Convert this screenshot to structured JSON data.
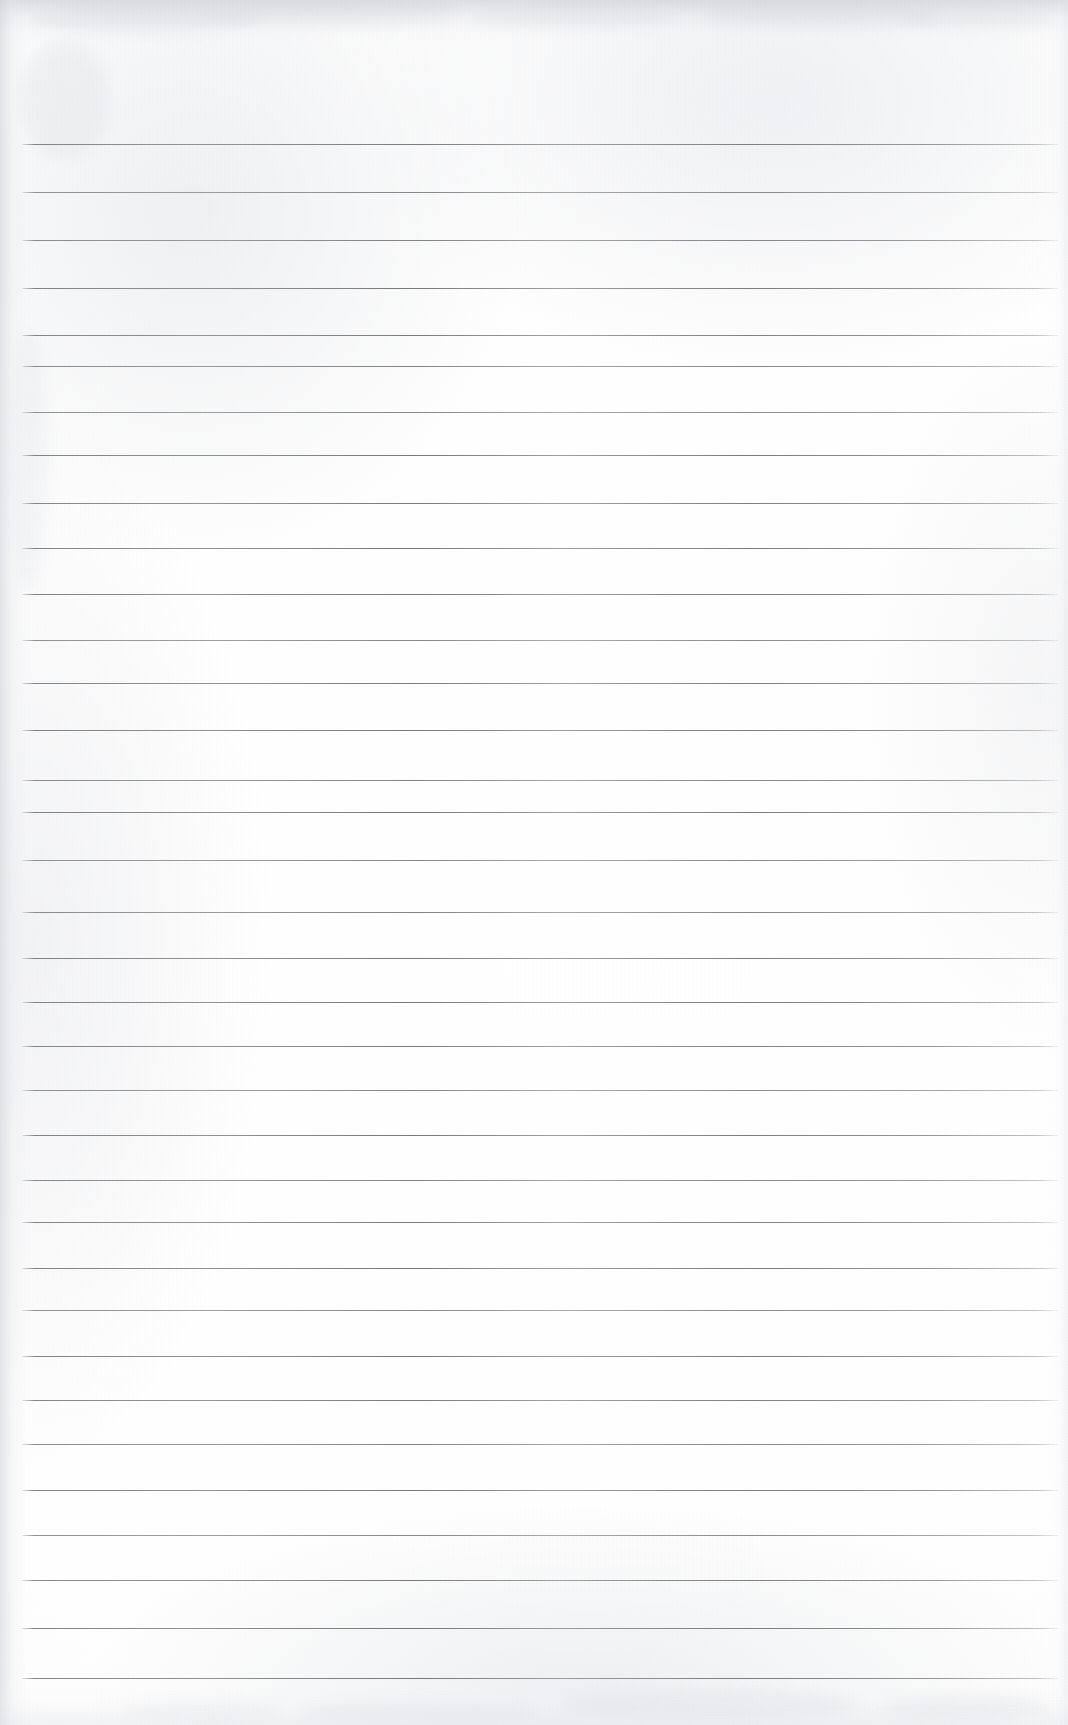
{
  "document": {
    "type": "scanned-blank-ruled-paper",
    "title": "Blank Ruled Notebook Page",
    "has_text_content": false,
    "visible_text": "",
    "page_width_px": 1068,
    "page_height_px": 1725
  },
  "paper": {
    "background_color": "#ffffff",
    "tone_color": "#fbfbfc",
    "edge_shadow_color": "#c4c7cd",
    "smudge_color": "#d8dbe0"
  },
  "ruling": {
    "line_color": "#767981",
    "line_thickness_px": 1,
    "line_count": 33,
    "left_x_px": 22,
    "right_x_px": 1058,
    "first_line_y_px": 144,
    "spacing_px": 47.9,
    "lines_y_px": [
      144,
      192,
      240,
      288,
      335,
      366,
      412,
      455,
      503,
      548,
      594,
      640,
      683,
      730,
      780,
      812,
      860,
      912,
      958,
      1002,
      1046,
      1090,
      1135,
      1180,
      1222,
      1268,
      1310,
      1356,
      1400,
      1444,
      1490,
      1535,
      1580,
      1628,
      1678
    ]
  },
  "smudges": [
    {
      "x": 30,
      "y": 6,
      "w": 230,
      "h": 26,
      "opacity": 0.4
    },
    {
      "x": 200,
      "y": 2,
      "w": 260,
      "h": 22,
      "opacity": 0.34
    },
    {
      "x": 470,
      "y": 8,
      "w": 210,
      "h": 20,
      "opacity": 0.3
    },
    {
      "x": 700,
      "y": 4,
      "w": 240,
      "h": 24,
      "opacity": 0.36
    },
    {
      "x": 900,
      "y": 10,
      "w": 150,
      "h": 18,
      "opacity": 0.28
    },
    {
      "x": 20,
      "y": 40,
      "w": 90,
      "h": 120,
      "opacity": 0.26
    },
    {
      "x": 8,
      "y": 330,
      "w": 40,
      "h": 260,
      "opacity": 0.22
    },
    {
      "x": 560,
      "y": 1690,
      "w": 300,
      "h": 30,
      "opacity": 0.34
    },
    {
      "x": 300,
      "y": 1700,
      "w": 240,
      "h": 24,
      "opacity": 0.28
    },
    {
      "x": 880,
      "y": 1695,
      "w": 170,
      "h": 26,
      "opacity": 0.3
    },
    {
      "x": 120,
      "y": 1702,
      "w": 160,
      "h": 20,
      "opacity": 0.22
    }
  ]
}
